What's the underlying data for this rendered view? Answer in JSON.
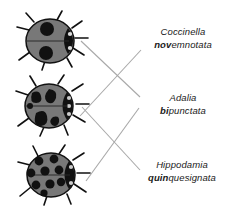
{
  "figure": {
    "background_color": "#ffffff",
    "line_color": "#a8a8a8",
    "body_color": "#787878",
    "spot_color": "#1a1a1a"
  },
  "specimens": [
    {
      "id": "coccinella-novemnotata",
      "genus": "Coccinella",
      "species_prefix": "nov",
      "species_rest": "emnotata",
      "illustration_name": "ladybug-two-large-spots"
    },
    {
      "id": "adalia-bipunctata",
      "genus": "Adalia",
      "species_prefix": "bi",
      "species_rest": "punctata",
      "illustration_name": "ladybug-irregular-blotches"
    },
    {
      "id": "hippodamia-quinquesignata",
      "genus": "Hippodamia",
      "species_prefix": "quin",
      "species_rest": "quesignata",
      "illustration_name": "ladybug-many-round-spots"
    }
  ],
  "connectors": [
    {
      "from": "beetle-top",
      "to": "label-adalia"
    },
    {
      "from": "beetle-middle",
      "to": "label-hippodamia"
    },
    {
      "from": "beetle-middle",
      "to": "label-coccinella"
    },
    {
      "from": "beetle-bottom",
      "to": "label-adalia"
    }
  ]
}
